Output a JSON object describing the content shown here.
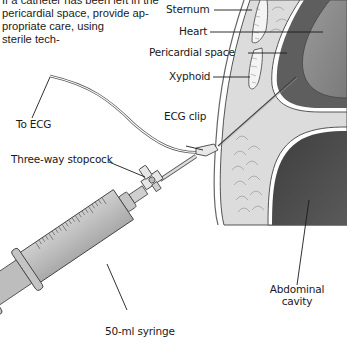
{
  "caption": {
    "lines": [
      "If a catheter has been left in the",
      "pericardial space, provide ap-",
      "propriate care, using",
      "sterile tech-"
    ]
  },
  "labels": {
    "sternum": "Sternum",
    "heart": "Heart",
    "pericardial_space": "Pericardial space",
    "xyphoid": "Xyphoid",
    "to_ecg": "To ECG",
    "ecg_clip": "ECG clip",
    "three_way_stopcock": "Three-way stopcock",
    "abdominal_cavity_line1": "Abdominal",
    "abdominal_cavity_line2": "cavity",
    "syringe": "50-ml syringe"
  },
  "colors": {
    "body_wall": "#d9d9d9",
    "fat": "#e4e4e4",
    "heart": "#8a8a8a",
    "pericardium": "#5c5c5c",
    "abdomen": "#4a4a4a",
    "syringe": "#bdbdbd"
  }
}
